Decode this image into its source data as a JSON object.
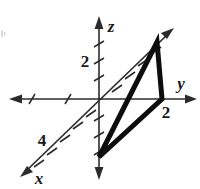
{
  "figure": {
    "kind": "3d-coordinate-axes-with-triangle",
    "background_color": "#ffffff",
    "ink_color": "#1a1a1a",
    "axes": [
      {
        "name": "z",
        "label": "z",
        "orientation": "vertical",
        "tick_label": "2",
        "tick_label_value": 2
      },
      {
        "name": "y",
        "label": "y",
        "orientation": "horizontal",
        "tick_label": "2",
        "tick_label_value": 2
      },
      {
        "name": "x",
        "label": "x",
        "orientation": "diagonal",
        "tick_label": "4",
        "tick_label_value": 4
      }
    ],
    "labels": {
      "z_axis": "z",
      "y_axis": "y",
      "x_axis": "x",
      "z_tick": "2",
      "y_tick": "2",
      "x_tick": "4"
    },
    "triangle": {
      "name": "shaded-triangle",
      "vertex_count": 3,
      "edge_color": "#0d0d0d"
    }
  }
}
